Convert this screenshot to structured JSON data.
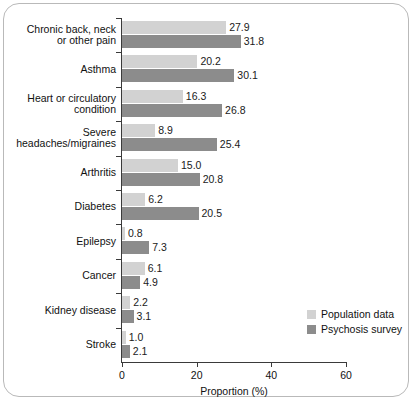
{
  "chart_data": {
    "type": "bar",
    "orientation": "horizontal",
    "title": "",
    "xlabel": "Proportion (%)",
    "ylabel": "",
    "xlim": [
      0,
      60
    ],
    "xticks": [
      0,
      20,
      40,
      60
    ],
    "grid": false,
    "legend_position": "bottom-right",
    "categories": [
      "Chronic back, neck or other pain",
      "Asthma",
      "Heart or circulatory condition",
      "Severe headaches/migraines",
      "Arthritis",
      "Diabetes",
      "Epilepsy",
      "Cancer",
      "Kidney disease",
      "Stroke"
    ],
    "category_lines": [
      [
        "Chronic back, neck",
        "or other pain"
      ],
      [
        "Asthma"
      ],
      [
        "Heart or circulatory",
        "condition"
      ],
      [
        "Severe",
        "headaches/migraines"
      ],
      [
        "Arthritis"
      ],
      [
        "Diabetes"
      ],
      [
        "Epilepsy"
      ],
      [
        "Cancer"
      ],
      [
        "Kidney disease"
      ],
      [
        "Stroke"
      ]
    ],
    "series": [
      {
        "name": "Population data",
        "color": "#d2d2d2",
        "values": [
          27.9,
          20.2,
          16.3,
          8.9,
          15.0,
          6.2,
          0.8,
          6.1,
          2.2,
          1.0
        ],
        "labels": [
          "27.9",
          "20.2",
          "16.3",
          "8.9",
          "15.0",
          "6.2",
          "0.8",
          "6.1",
          "2.2",
          "1.0"
        ]
      },
      {
        "name": "Psychosis survey",
        "color": "#8c8c8c",
        "values": [
          31.8,
          30.1,
          26.8,
          25.4,
          20.8,
          20.5,
          7.3,
          4.9,
          3.1,
          2.1
        ],
        "labels": [
          "31.8",
          "30.1",
          "26.8",
          "25.4",
          "20.8",
          "20.5",
          "7.3",
          "4.9",
          "3.1",
          "2.1"
        ]
      }
    ]
  },
  "legend": {
    "items": [
      {
        "label": "Population data",
        "color": "#d2d2d2"
      },
      {
        "label": "Psychosis survey",
        "color": "#8c8c8c"
      }
    ]
  },
  "axis": {
    "x_label": "Proportion (%)",
    "x_tick_labels": [
      "0",
      "20",
      "40",
      "60"
    ]
  }
}
